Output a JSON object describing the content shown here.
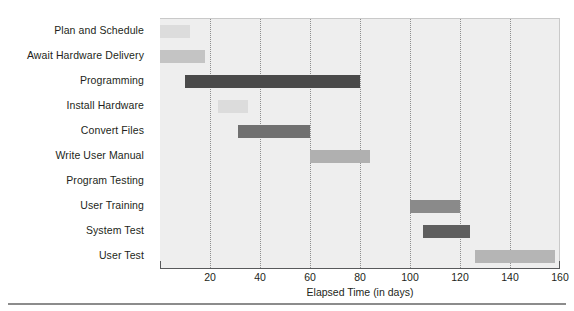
{
  "chart_data": {
    "type": "bar",
    "subtype": "gantt",
    "title": "",
    "xlabel": "Elapsed Time (in days)",
    "ylabel": "",
    "xlim": [
      0,
      160
    ],
    "xticks": [
      20,
      40,
      60,
      80,
      100,
      120,
      140,
      160
    ],
    "xtick_labels": [
      "20",
      "40",
      "60",
      "80",
      "100",
      "120",
      "140",
      "160"
    ],
    "grid": "vertical-dotted",
    "legend": "none",
    "categories": [
      "Plan and Schedule",
      "Await Hardware Delivery",
      "Programming",
      "Install Hardware",
      "Convert Files",
      "Write User Manual",
      "Program Testing",
      "User Training",
      "System Test",
      "User Test"
    ],
    "tasks": [
      {
        "name": "Plan and Schedule",
        "start": 0,
        "end": 12,
        "duration": 12,
        "color": "#dcdcdc"
      },
      {
        "name": "Await Hardware Delivery",
        "start": 0,
        "end": 18,
        "duration": 18,
        "color": "#c4c4c4"
      },
      {
        "name": "Programming",
        "start": 10,
        "end": 80,
        "duration": 70,
        "color": "#4a4a4a"
      },
      {
        "name": "Install Hardware",
        "start": 23,
        "end": 35,
        "duration": 12,
        "color": "#dcdcdc"
      },
      {
        "name": "Convert Files",
        "start": 31,
        "end": 60,
        "duration": 29,
        "color": "#707070"
      },
      {
        "name": "Write User Manual",
        "start": 60,
        "end": 84,
        "duration": 24,
        "color": "#b0b0b0"
      },
      {
        "name": "Program Testing",
        "start": 0,
        "end": 0,
        "duration": 0,
        "color": "#eeeeee"
      },
      {
        "name": "User Training",
        "start": 100,
        "end": 120,
        "duration": 20,
        "color": "#8a8a8a"
      },
      {
        "name": "System Test",
        "start": 105,
        "end": 124,
        "duration": 19,
        "color": "#5e5e5e"
      },
      {
        "name": "User Test",
        "start": 126,
        "end": 158,
        "duration": 32,
        "color": "#b5b5b5"
      }
    ],
    "colors": {
      "plot_background": "#eeeeee",
      "gridline": "#8e8e8e",
      "axis": "#58595b",
      "text": "#231f20",
      "page_background": "#ffffff",
      "bottom_rule": "#8c8c8c"
    }
  }
}
